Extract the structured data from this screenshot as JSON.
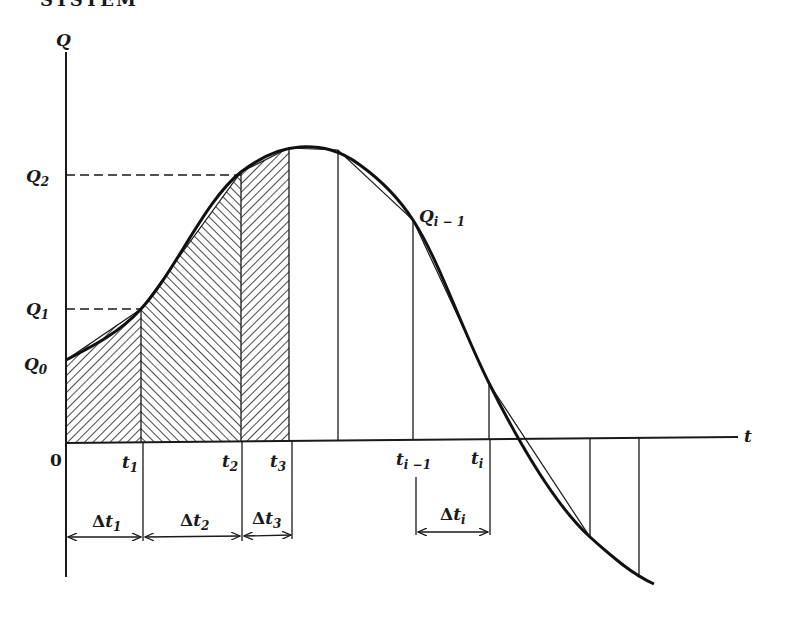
{
  "heading": "SYSTEM",
  "axes": {
    "y_label": "Q",
    "x_label": "t",
    "origin_label": "0"
  },
  "y_labels": [
    {
      "base": "Q",
      "sub": "0"
    },
    {
      "base": "Q",
      "sub": "1"
    },
    {
      "base": "Q",
      "sub": "2"
    }
  ],
  "point_label": {
    "base": "Q",
    "sub": "i − 1"
  },
  "x_ticks": [
    {
      "base": "t",
      "sub": "1"
    },
    {
      "base": "t",
      "sub": "2"
    },
    {
      "base": "t",
      "sub": "3"
    },
    {
      "base": "t",
      "sub": "i −1"
    },
    {
      "base": "t",
      "sub": "i"
    }
  ],
  "intervals": [
    {
      "delta": "Δ",
      "base": "t",
      "sub": "1"
    },
    {
      "delta": "Δ",
      "base": "t",
      "sub": "2"
    },
    {
      "delta": "Δ",
      "base": "t",
      "sub": "3"
    },
    {
      "delta": "Δ",
      "base": "t",
      "sub": "i"
    }
  ]
}
